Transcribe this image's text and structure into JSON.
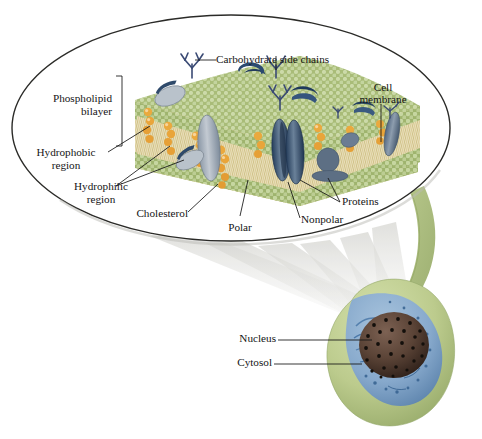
{
  "figure": {
    "type": "biology-diagram",
    "background_color": "#ffffff"
  },
  "magnifier": {
    "shape": "ellipse",
    "outline_color": "#2b2b28",
    "fill_color": "#ffffff",
    "name": "magnified-membrane-view"
  },
  "labels": {
    "carbohydrate_side_chains": "Carbohydrate side chains",
    "cell_membrane_line1": "Cell",
    "cell_membrane_line2": "membrane",
    "phospholipid_line1": "Phospholipid",
    "phospholipid_line2": "bilayer",
    "hydrophobic_line1": "Hydrophobic",
    "hydrophobic_line2": "region",
    "hydrophilic_line1": "Hydrophilic",
    "hydrophilic_line2": "region",
    "cholesterol": "Cholesterol",
    "polar": "Polar",
    "nonpolar": "Nonpolar",
    "proteins": "Proteins",
    "nucleus": "Nucleus",
    "cytosol": "Cytosol"
  },
  "colors": {
    "phospholipid_head_green": "#aebf7e",
    "phospholipid_head_light": "#cfdcae",
    "lipid_tail_tan": "#ded2a6",
    "lipid_tail_cream": "#efe8cc",
    "cholesterol_orange": "#e9a83c",
    "cholesterol_orange_light": "#f3c877",
    "protein_blue_gray": "#6b7d93",
    "protein_dark_blue": "#2c4566",
    "protein_light_gray": "#b3bcc6",
    "carbohydrate_navy": "#3a4a74",
    "leader_line": "#1a1a1a",
    "cell_outer_green": "#bccb8d",
    "cytosol_blue": "#7fa3c8",
    "cytosol_blue_dark": "#3f6fa3",
    "nucleus_brown": "#5a4336",
    "nucleus_pore": "#14100c",
    "beam_gray": "#c9c9c4"
  },
  "cell": {
    "name": "whole-cell-illustration",
    "parts": [
      "outer membrane",
      "cytosol",
      "nucleus",
      "nuclear pores"
    ]
  },
  "membrane_structure": {
    "layers": [
      "outer phospholipid heads",
      "hydrophobic fatty-acid tails",
      "inner phospholipid heads"
    ],
    "embedded": [
      "integral proteins",
      "peripheral proteins",
      "cholesterol",
      "carbohydrate side chains"
    ]
  }
}
